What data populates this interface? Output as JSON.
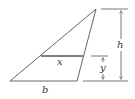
{
  "diagram": {
    "type": "triangle-with-cross-section",
    "labels": {
      "base": "b",
      "height": "h",
      "segment": "x",
      "distance": "y"
    },
    "colors": {
      "stroke": "#555555",
      "text": "#333333",
      "background": "#ffffff"
    }
  }
}
